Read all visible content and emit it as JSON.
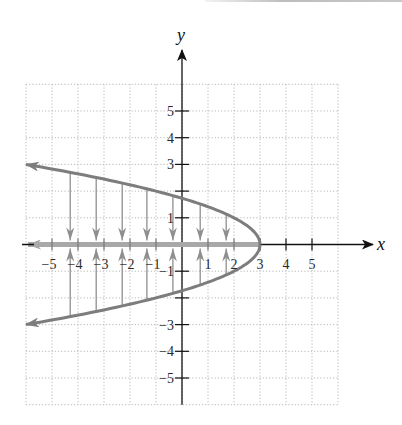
{
  "chart_data": {
    "type": "line",
    "title": "",
    "xlabel": "x",
    "ylabel": "y",
    "xlim": [
      -6,
      6
    ],
    "ylim": [
      -6,
      6
    ],
    "grid": true,
    "grid_style": "dotted",
    "x_ticks": [
      -5,
      -4,
      -3,
      -2,
      -1,
      1,
      2,
      3,
      4,
      5
    ],
    "y_ticks": [
      -5,
      -4,
      -3,
      -1,
      1,
      3,
      4,
      5
    ],
    "x_tick_labels": [
      "−5",
      "−4",
      "−3",
      "−2",
      "−1",
      "1",
      "2",
      "3",
      "4",
      "5"
    ],
    "y_tick_labels": [
      "5",
      "4",
      "3",
      "1",
      "−1",
      "−3",
      "−4",
      "−5"
    ],
    "series": [
      {
        "name": "parabola x = 3 - y^2",
        "equation": "x = 3 - y^2",
        "vertex": [
          3,
          0
        ],
        "color": "#7d7d7d",
        "endpoints_arrows": [
          [
            -6,
            3
          ],
          [
            -6,
            -3
          ]
        ],
        "points": [
          [
            -6,
            3
          ],
          [
            -4.29,
            2.7
          ],
          [
            -1,
            2
          ],
          [
            0,
            1.73
          ],
          [
            2,
            1
          ],
          [
            3,
            0
          ],
          [
            2,
            -1
          ],
          [
            0,
            -1.73
          ],
          [
            -1,
            -2
          ],
          [
            -4.29,
            -2.7
          ],
          [
            -6,
            -3
          ]
        ]
      },
      {
        "name": "projection onto x-axis (range)",
        "interval": "(-inf, 3]",
        "color": "#9e9e9e",
        "points": [
          [
            3,
            0
          ],
          [
            -6,
            0
          ]
        ]
      }
    ],
    "projection_arrows_x": [
      -4.3,
      -3.3,
      -2.3,
      -1.35,
      -0.35,
      0.7,
      1.7
    ]
  },
  "labels": {
    "x_axis": "x",
    "y_axis": "y"
  },
  "colors": {
    "axis": "#111111",
    "curve": "#7d7d7d",
    "projection": "#8f8f8f",
    "range_ray": "#a8a8a8",
    "grid": "#b8b8b8"
  }
}
